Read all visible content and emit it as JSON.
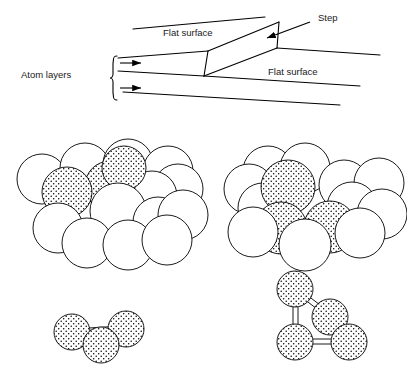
{
  "figure": {
    "background_color": "#ffffff",
    "line_color": "#000000",
    "sphere_fill_plain": "#ffffff",
    "sphere_fill_dotted": "#ffffff",
    "dot_color": "#000000",
    "text_color": "#1a1a1a"
  },
  "top_diagram": {
    "labels": {
      "flat_surface_upper": "Flat surface",
      "flat_surface_lower": "Flat surface",
      "step": "Step",
      "atom_layers": "Atom layers"
    },
    "annotations": {
      "bracket_name": "atom-layers-bracket",
      "arrow_count": 2,
      "step_pointer": "leader-line-with-arrowhead"
    },
    "terrace_lines": 5
  },
  "clusters": {
    "top_left": {
      "name": "fcc-111-terrace-cluster",
      "plain_spheres": 12,
      "dotted_spheres": 3,
      "description": "Close-packed sphere model of a flat surface with three shaded adatom sites"
    },
    "top_right": {
      "name": "fcc-stepped-cluster",
      "plain_spheres": 10,
      "dotted_spheres": 3,
      "description": "Close-packed sphere model of a stepped surface with three shaded atoms"
    },
    "bottom_left": {
      "name": "three-atom-bridge-cluster",
      "dotted_spheres": 3,
      "bonds": 2,
      "description": "Three bonded atoms in a bent arrangement"
    },
    "bottom_right": {
      "name": "four-atom-tetrahedral-cluster",
      "dotted_spheres": 4,
      "bonds": 4,
      "description": "Four bonded atoms in a tetrahedral arrangement"
    }
  }
}
